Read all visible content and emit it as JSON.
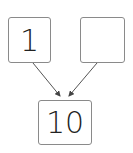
{
  "diagram": {
    "type": "number-bond",
    "parts": [
      {
        "label": "1"
      },
      {
        "label": ""
      }
    ],
    "whole": {
      "label": "10"
    },
    "colors": {
      "border": "#8a8a8a",
      "text": "#222222",
      "arrow": "#555555"
    }
  }
}
